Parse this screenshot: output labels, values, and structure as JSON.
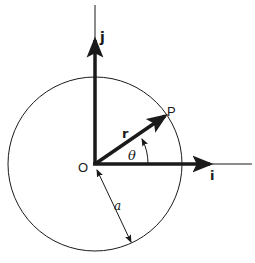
{
  "diagram": {
    "labels": {
      "unit_j": "j",
      "unit_i": "i",
      "origin": "O",
      "point": "P",
      "vector_r": "r",
      "angle": "θ",
      "radius": "a"
    },
    "angle_degrees": 30,
    "colors": {
      "ink": "#1a1a1a",
      "background": "#ffffff"
    }
  }
}
